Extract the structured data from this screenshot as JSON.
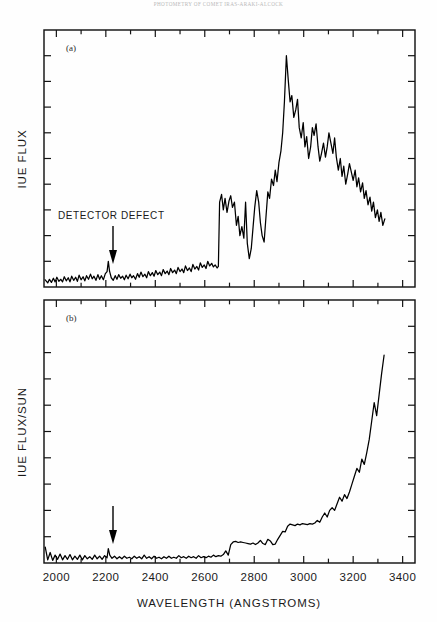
{
  "header": {
    "running_head": "PHOTOMETRY OF COMET IRAS-ARAKI-ALCOCK"
  },
  "figure": {
    "xaxis_title": "WAVELENGTH (ANGSTROMS)",
    "panel_a": {
      "label": "(a)",
      "yaxis_title": "IUE FLUX",
      "annotation": "DETECTOR DEFECT",
      "annotation_wavelength": 2210
    },
    "panel_b": {
      "label": "(b)",
      "yaxis_title": "IUE FLUX/SUN",
      "annotation_wavelength": 2210
    },
    "xticks": [
      "2000",
      "2200",
      "2400",
      "2600",
      "2800",
      "3000",
      "3200",
      "3400"
    ],
    "colors": {
      "ink": "#000000",
      "frame": "#141414",
      "background": "#ffffff"
    }
  },
  "chart_data": [
    {
      "type": "line",
      "panel": "a",
      "title": "IUE Flux vs Wavelength",
      "xlabel": "WAVELENGTH (ANGSTROMS)",
      "ylabel": "IUE FLUX",
      "xlim": [
        1950,
        3450
      ],
      "ylim": [
        0,
        1
      ],
      "xticks": [
        2000,
        2200,
        2400,
        2600,
        2800,
        3000,
        3200,
        3400
      ],
      "yticks_count": 10,
      "grid": false,
      "legend": "none",
      "annotations": [
        {
          "text": "DETECTOR DEFECT",
          "x": 2210,
          "y": 0.17,
          "arrow_to_y": 0.06
        }
      ],
      "x": [
        1955,
        1965,
        1972,
        1980,
        1988,
        1995,
        2002,
        2010,
        2018,
        2025,
        2032,
        2040,
        2048,
        2055,
        2062,
        2070,
        2078,
        2085,
        2092,
        2100,
        2108,
        2115,
        2122,
        2130,
        2138,
        2145,
        2152,
        2160,
        2168,
        2175,
        2182,
        2190,
        2198,
        2205,
        2210,
        2215,
        2222,
        2230,
        2238,
        2245,
        2252,
        2260,
        2268,
        2275,
        2282,
        2290,
        2298,
        2305,
        2312,
        2320,
        2328,
        2335,
        2342,
        2350,
        2358,
        2365,
        2372,
        2380,
        2388,
        2395,
        2402,
        2410,
        2418,
        2425,
        2432,
        2440,
        2448,
        2455,
        2462,
        2470,
        2478,
        2485,
        2492,
        2500,
        2508,
        2515,
        2522,
        2530,
        2538,
        2545,
        2552,
        2560,
        2568,
        2575,
        2582,
        2590,
        2598,
        2605,
        2612,
        2620,
        2628,
        2635,
        2642,
        2650,
        2655,
        2660,
        2668,
        2675,
        2682,
        2690,
        2698,
        2705,
        2712,
        2720,
        2728,
        2735,
        2742,
        2750,
        2758,
        2765,
        2772,
        2780,
        2788,
        2795,
        2802,
        2810,
        2818,
        2825,
        2832,
        2840,
        2848,
        2855,
        2862,
        2870,
        2878,
        2885,
        2892,
        2900,
        2908,
        2915,
        2922,
        2930,
        2938,
        2945,
        2952,
        2960,
        2968,
        2975,
        2982,
        2990,
        2998,
        3005,
        3012,
        3020,
        3028,
        3035,
        3042,
        3050,
        3058,
        3065,
        3072,
        3080,
        3088,
        3095,
        3102,
        3110,
        3118,
        3125,
        3132,
        3140,
        3148,
        3155,
        3162,
        3170,
        3178,
        3185,
        3192,
        3200,
        3208,
        3215,
        3222,
        3230,
        3238,
        3245,
        3252,
        3260,
        3268,
        3275,
        3282,
        3290,
        3298,
        3305,
        3312,
        3320,
        3328
      ],
      "y": [
        0.028,
        0.016,
        0.03,
        0.018,
        0.034,
        0.02,
        0.038,
        0.022,
        0.03,
        0.02,
        0.04,
        0.024,
        0.036,
        0.02,
        0.042,
        0.026,
        0.038,
        0.022,
        0.046,
        0.028,
        0.04,
        0.024,
        0.044,
        0.03,
        0.05,
        0.032,
        0.042,
        0.026,
        0.048,
        0.03,
        0.044,
        0.028,
        0.052,
        0.06,
        0.1,
        0.062,
        0.036,
        0.026,
        0.044,
        0.03,
        0.048,
        0.034,
        0.042,
        0.028,
        0.046,
        0.032,
        0.05,
        0.036,
        0.044,
        0.03,
        0.052,
        0.038,
        0.058,
        0.04,
        0.05,
        0.036,
        0.06,
        0.044,
        0.056,
        0.042,
        0.064,
        0.048,
        0.058,
        0.044,
        0.068,
        0.052,
        0.062,
        0.048,
        0.072,
        0.056,
        0.066,
        0.052,
        0.076,
        0.06,
        0.07,
        0.056,
        0.082,
        0.064,
        0.074,
        0.06,
        0.088,
        0.07,
        0.08,
        0.066,
        0.094,
        0.076,
        0.086,
        0.072,
        0.1,
        0.082,
        0.092,
        0.078,
        0.086,
        0.074,
        0.08,
        0.33,
        0.36,
        0.3,
        0.345,
        0.29,
        0.335,
        0.355,
        0.31,
        0.33,
        0.24,
        0.275,
        0.2,
        0.235,
        0.19,
        0.33,
        0.17,
        0.11,
        0.15,
        0.23,
        0.31,
        0.375,
        0.33,
        0.25,
        0.2,
        0.175,
        0.28,
        0.37,
        0.345,
        0.42,
        0.395,
        0.455,
        0.41,
        0.485,
        0.53,
        0.6,
        0.72,
        0.9,
        0.8,
        0.72,
        0.745,
        0.66,
        0.69,
        0.73,
        0.62,
        0.58,
        0.64,
        0.545,
        0.585,
        0.5,
        0.545,
        0.62,
        0.59,
        0.635,
        0.545,
        0.49,
        0.52,
        0.56,
        0.505,
        0.545,
        0.6,
        0.56,
        0.52,
        0.58,
        0.505,
        0.455,
        0.5,
        0.43,
        0.47,
        0.4,
        0.44,
        0.48,
        0.45,
        0.415,
        0.455,
        0.39,
        0.425,
        0.37,
        0.405,
        0.345,
        0.375,
        0.32,
        0.35,
        0.295,
        0.33,
        0.27,
        0.3,
        0.255,
        0.29,
        0.24,
        0.265
      ]
    },
    {
      "type": "line",
      "panel": "b",
      "title": "IUE Flux / Solar Flux vs Wavelength",
      "xlabel": "WAVELENGTH (ANGSTROMS)",
      "ylabel": "IUE FLUX/SUN",
      "xlim": [
        1950,
        3450
      ],
      "ylim": [
        0,
        1
      ],
      "xticks": [
        2000,
        2200,
        2400,
        2600,
        2800,
        3000,
        3200,
        3400
      ],
      "yticks_count": 10,
      "grid": false,
      "legend": "none",
      "annotations": [
        {
          "text": "",
          "x": 2210,
          "y": 0.28,
          "arrow_to_y": 0.09
        }
      ],
      "x": [
        1955,
        1965,
        1975,
        1985,
        1995,
        2005,
        2015,
        2025,
        2035,
        2045,
        2055,
        2065,
        2075,
        2085,
        2095,
        2105,
        2115,
        2125,
        2135,
        2145,
        2155,
        2165,
        2175,
        2185,
        2195,
        2205,
        2210,
        2216,
        2225,
        2235,
        2245,
        2255,
        2265,
        2275,
        2285,
        2295,
        2305,
        2315,
        2325,
        2335,
        2345,
        2355,
        2365,
        2375,
        2385,
        2395,
        2405,
        2415,
        2425,
        2435,
        2445,
        2455,
        2465,
        2475,
        2485,
        2495,
        2505,
        2515,
        2525,
        2535,
        2545,
        2555,
        2565,
        2575,
        2585,
        2595,
        2605,
        2615,
        2625,
        2635,
        2645,
        2655,
        2665,
        2675,
        2685,
        2695,
        2705,
        2715,
        2725,
        2735,
        2745,
        2755,
        2765,
        2775,
        2785,
        2795,
        2805,
        2815,
        2825,
        2835,
        2845,
        2855,
        2865,
        2875,
        2885,
        2895,
        2905,
        2915,
        2925,
        2935,
        2945,
        2955,
        2965,
        2975,
        2985,
        2995,
        3005,
        3015,
        3025,
        3035,
        3045,
        3055,
        3065,
        3075,
        3085,
        3095,
        3105,
        3115,
        3125,
        3135,
        3145,
        3155,
        3165,
        3175,
        3185,
        3195,
        3205,
        3215,
        3225,
        3235,
        3245,
        3255,
        3265,
        3275,
        3285,
        3295,
        3305,
        3315,
        3325
      ],
      "y": [
        0.06,
        0.012,
        0.04,
        0.01,
        0.03,
        0.014,
        0.034,
        0.012,
        0.028,
        0.014,
        0.032,
        0.012,
        0.026,
        0.014,
        0.03,
        0.012,
        0.028,
        0.016,
        0.024,
        0.014,
        0.03,
        0.016,
        0.026,
        0.014,
        0.028,
        0.02,
        0.055,
        0.03,
        0.018,
        0.026,
        0.016,
        0.024,
        0.016,
        0.026,
        0.018,
        0.022,
        0.016,
        0.026,
        0.018,
        0.024,
        0.016,
        0.03,
        0.018,
        0.024,
        0.016,
        0.026,
        0.018,
        0.022,
        0.016,
        0.024,
        0.018,
        0.026,
        0.018,
        0.022,
        0.018,
        0.028,
        0.02,
        0.024,
        0.018,
        0.026,
        0.02,
        0.024,
        0.018,
        0.028,
        0.02,
        0.024,
        0.02,
        0.026,
        0.022,
        0.03,
        0.024,
        0.028,
        0.026,
        0.032,
        0.046,
        0.03,
        0.07,
        0.08,
        0.082,
        0.078,
        0.08,
        0.078,
        0.076,
        0.074,
        0.072,
        0.076,
        0.07,
        0.076,
        0.086,
        0.074,
        0.07,
        0.09,
        0.084,
        0.07,
        0.072,
        0.09,
        0.105,
        0.12,
        0.118,
        0.14,
        0.148,
        0.145,
        0.142,
        0.148,
        0.145,
        0.15,
        0.148,
        0.146,
        0.15,
        0.148,
        0.152,
        0.162,
        0.155,
        0.175,
        0.19,
        0.175,
        0.2,
        0.21,
        0.2,
        0.225,
        0.25,
        0.235,
        0.26,
        0.245,
        0.27,
        0.3,
        0.33,
        0.36,
        0.345,
        0.395,
        0.375,
        0.42,
        0.47,
        0.54,
        0.61,
        0.56,
        0.64,
        0.72,
        0.79
      ]
    }
  ]
}
